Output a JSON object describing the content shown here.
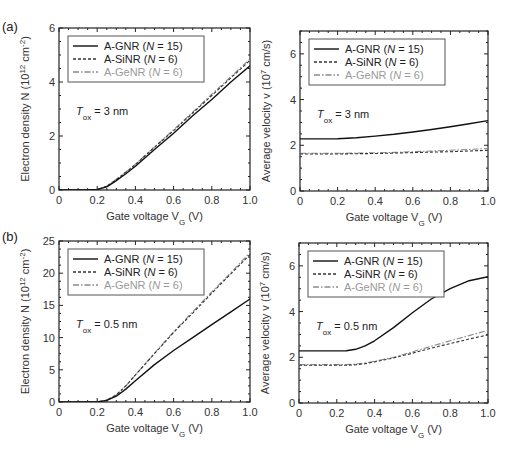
{
  "figure": {
    "panel_labels": [
      "(a)",
      "(b)"
    ]
  },
  "chart_data": [
    {
      "id": "a-left",
      "type": "line",
      "panel": "(a)",
      "title": "",
      "xlabel": "Gate voltage V_G (V)",
      "ylabel": "Electron density N (10^12 cm^-2)",
      "xlim": [
        0,
        1.0
      ],
      "ylim": [
        0,
        6
      ],
      "xticks": [
        0,
        0.2,
        0.4,
        0.6,
        0.8,
        1.0
      ],
      "xtick_labels": [
        "0",
        "0.2",
        "0.4",
        "0.6",
        "0.8",
        "1.0"
      ],
      "yticks": [
        0,
        2,
        4,
        6
      ],
      "ytick_labels": [
        "0",
        "2",
        "4",
        "6"
      ],
      "annotation": "T_ox = 3 nm",
      "legend_position": "upper left",
      "grid": false,
      "x": [
        0,
        0.1,
        0.15,
        0.2,
        0.25,
        0.3,
        0.35,
        0.4,
        0.5,
        0.6,
        0.7,
        0.8,
        0.9,
        1.0
      ],
      "series": [
        {
          "name": "A-GNR (N = 15)",
          "style": "solid",
          "color": "#111111",
          "values": [
            0,
            0,
            0,
            0.02,
            0.12,
            0.35,
            0.6,
            0.88,
            1.5,
            2.1,
            2.75,
            3.35,
            4.0,
            4.6
          ]
        },
        {
          "name": "A-SiNR (N = 6)",
          "style": "dashed",
          "color": "#333333",
          "values": [
            0,
            0,
            0,
            0.02,
            0.14,
            0.38,
            0.65,
            0.94,
            1.58,
            2.2,
            2.85,
            3.5,
            4.15,
            4.8
          ]
        },
        {
          "name": "A-GeNR (N = 6)",
          "style": "dashdot",
          "color": "#8a8a8a",
          "values": [
            0,
            0,
            0,
            0.02,
            0.15,
            0.4,
            0.67,
            0.96,
            1.6,
            2.23,
            2.88,
            3.55,
            4.2,
            4.85
          ]
        }
      ]
    },
    {
      "id": "a-right",
      "type": "line",
      "panel": "(a)",
      "title": "",
      "xlabel": "Gate voltage V_G (V)",
      "ylabel": "Average velocity v (10^7 cm/s)",
      "xlim": [
        0,
        1.0
      ],
      "ylim": [
        0,
        7
      ],
      "xticks": [
        0,
        0.2,
        0.4,
        0.6,
        0.8,
        1.0
      ],
      "xtick_labels": [
        "0",
        "0.2",
        "0.4",
        "0.6",
        "0.8",
        "1.0"
      ],
      "yticks": [
        0,
        2,
        4,
        6
      ],
      "ytick_labels": [
        "0",
        "2",
        "4",
        "6"
      ],
      "annotation": "T_ox = 3 nm",
      "legend_position": "upper left",
      "grid": false,
      "x": [
        0,
        0.1,
        0.2,
        0.3,
        0.4,
        0.5,
        0.6,
        0.7,
        0.8,
        0.9,
        1.0
      ],
      "series": [
        {
          "name": "A-GNR (N = 15)",
          "style": "solid",
          "color": "#111111",
          "values": [
            2.28,
            2.28,
            2.29,
            2.33,
            2.4,
            2.48,
            2.58,
            2.69,
            2.81,
            2.94,
            3.08
          ]
        },
        {
          "name": "A-SiNR (N = 6)",
          "style": "dashed",
          "color": "#333333",
          "values": [
            1.62,
            1.62,
            1.62,
            1.63,
            1.64,
            1.66,
            1.68,
            1.7,
            1.72,
            1.75,
            1.78
          ]
        },
        {
          "name": "A-GeNR (N = 6)",
          "style": "dashdot",
          "color": "#8a8a8a",
          "values": [
            1.65,
            1.65,
            1.65,
            1.66,
            1.67,
            1.69,
            1.72,
            1.75,
            1.78,
            1.82,
            1.86
          ]
        }
      ]
    },
    {
      "id": "b-left",
      "type": "line",
      "panel": "(b)",
      "title": "",
      "xlabel": "Gate voltage V_G (V)",
      "ylabel": "Electron density N (10^12 cm^-2)",
      "xlim": [
        0,
        1.0
      ],
      "ylim": [
        0,
        25
      ],
      "xticks": [
        0,
        0.2,
        0.4,
        0.6,
        0.8,
        1.0
      ],
      "xtick_labels": [
        "0",
        "0.2",
        "0.4",
        "0.6",
        "0.8",
        "1.0"
      ],
      "yticks": [
        0,
        5,
        10,
        15,
        20,
        25
      ],
      "ytick_labels": [
        "0",
        "5",
        "10",
        "15",
        "20",
        "25"
      ],
      "annotation": "T_ox = 0.5 nm",
      "legend_position": "upper left",
      "grid": false,
      "x": [
        0,
        0.1,
        0.2,
        0.25,
        0.3,
        0.35,
        0.4,
        0.5,
        0.6,
        0.7,
        0.8,
        0.9,
        1.0
      ],
      "series": [
        {
          "name": "A-GNR (N = 15)",
          "style": "solid",
          "color": "#111111",
          "values": [
            0,
            0,
            0,
            0.25,
            0.9,
            2.0,
            3.3,
            5.8,
            8.0,
            10.0,
            12.0,
            14.0,
            16.0
          ]
        },
        {
          "name": "A-SiNR (N = 6)",
          "style": "dashed",
          "color": "#333333",
          "values": [
            0,
            0,
            0,
            0.3,
            1.1,
            2.5,
            4.2,
            7.5,
            10.8,
            13.8,
            16.9,
            19.9,
            22.9
          ]
        },
        {
          "name": "A-GeNR (N = 6)",
          "style": "dashdot",
          "color": "#8a8a8a",
          "values": [
            0,
            0,
            0,
            0.3,
            1.1,
            2.5,
            4.2,
            7.6,
            10.9,
            14.0,
            17.1,
            20.1,
            23.2
          ]
        }
      ]
    },
    {
      "id": "b-right",
      "type": "line",
      "panel": "(b)",
      "title": "",
      "xlabel": "Gate voltage V_G (V)",
      "ylabel": "Average velocity v (10^7 cm/s)",
      "xlim": [
        0,
        1.0
      ],
      "ylim": [
        0,
        7
      ],
      "xticks": [
        0,
        0.2,
        0.4,
        0.6,
        0.8,
        1.0
      ],
      "xtick_labels": [
        "0",
        "0.2",
        "0.4",
        "0.6",
        "0.8",
        "1.0"
      ],
      "yticks": [
        0,
        2,
        4,
        6
      ],
      "ytick_labels": [
        "0",
        "2",
        "4",
        "6"
      ],
      "annotation": "T_ox = 0.5 nm",
      "legend_position": "upper left",
      "grid": false,
      "x": [
        0,
        0.1,
        0.2,
        0.25,
        0.3,
        0.35,
        0.4,
        0.5,
        0.6,
        0.7,
        0.8,
        0.9,
        1.0
      ],
      "series": [
        {
          "name": "A-GNR (N = 15)",
          "style": "solid",
          "color": "#111111",
          "values": [
            2.28,
            2.28,
            2.28,
            2.29,
            2.35,
            2.5,
            2.72,
            3.3,
            3.95,
            4.55,
            5.0,
            5.35,
            5.52
          ]
        },
        {
          "name": "A-SiNR (N = 6)",
          "style": "dashed",
          "color": "#333333",
          "values": [
            1.65,
            1.65,
            1.65,
            1.65,
            1.67,
            1.72,
            1.8,
            1.97,
            2.18,
            2.4,
            2.6,
            2.8,
            2.98
          ]
        },
        {
          "name": "A-GeNR (N = 6)",
          "style": "dashdot",
          "color": "#8a8a8a",
          "values": [
            1.68,
            1.68,
            1.68,
            1.68,
            1.7,
            1.75,
            1.83,
            2.0,
            2.24,
            2.48,
            2.72,
            2.95,
            3.18
          ]
        }
      ]
    }
  ]
}
